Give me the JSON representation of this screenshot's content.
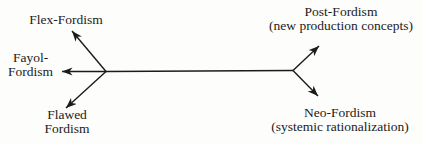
{
  "diagram": {
    "colors": {
      "ink": "#1b1b1b",
      "background": "#fdfdfc"
    },
    "nodes": {
      "flex": {
        "label": "Flex-Fordism"
      },
      "fayol": {
        "line1": "Fayol-",
        "line2": "Fordism"
      },
      "flawed": {
        "line1": "Flawed",
        "line2": "Fordism"
      },
      "post": {
        "label": "Post-Fordism",
        "sublabel": "(new production concepts)"
      },
      "neo": {
        "label": "Neo-Fordism",
        "sublabel": "(systemic rationalization)"
      }
    },
    "arrows": [
      {
        "from": "left-branch-point",
        "to": "Flex-Fordism",
        "direction": "up-left"
      },
      {
        "from": "left-branch-point",
        "to": "Fayol-Fordism",
        "direction": "left"
      },
      {
        "from": "left-branch-point",
        "to": "Flawed Fordism",
        "direction": "down-left"
      },
      {
        "from": "right-branch-point",
        "to": "Post-Fordism",
        "direction": "up-right"
      },
      {
        "from": "right-branch-point",
        "to": "Neo-Fordism",
        "direction": "down-right"
      },
      {
        "from": "left-branch-point",
        "to": "right-branch-point",
        "direction": "horizontal-trunk"
      }
    ]
  }
}
